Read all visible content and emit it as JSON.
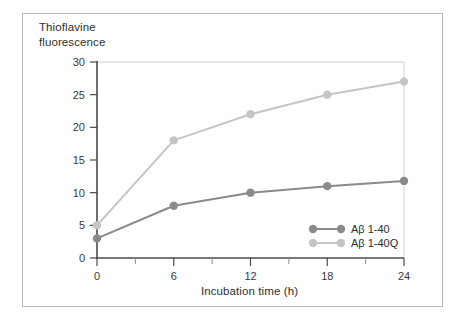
{
  "chart_data": {
    "type": "line",
    "title": "",
    "subtitle": "",
    "xlabel": "Incubation time (h)",
    "ylabel": "Thioflavine\nfluorescence",
    "x": [
      0,
      6,
      12,
      18,
      24
    ],
    "categories": [
      "0",
      "6",
      "12",
      "18",
      "24"
    ],
    "xlim": [
      0,
      24
    ],
    "ylim": [
      0,
      30
    ],
    "x_ticks": [
      0,
      6,
      12,
      18,
      24
    ],
    "x_tick_labels": [
      "0",
      "6",
      "12",
      "18",
      "24"
    ],
    "x_minor_ticks": [
      3,
      9,
      15,
      21
    ],
    "y_ticks": [
      0,
      5,
      10,
      15,
      20,
      25,
      30
    ],
    "y_tick_labels": [
      "0",
      "5",
      "10",
      "15",
      "20",
      "25",
      "30"
    ],
    "grid": false,
    "legend_position": "inside bottom-right",
    "series": [
      {
        "name": "Aβ 1-40",
        "color": "#8a8a8a",
        "marker": "circle",
        "values": [
          3,
          8,
          10,
          11,
          11.8
        ]
      },
      {
        "name": "Aβ 1-40Q",
        "color": "#c5c5c5",
        "marker": "circle",
        "values": [
          5,
          18,
          22,
          25,
          27
        ]
      }
    ]
  },
  "legend": {
    "entries": [
      {
        "label": "Aβ 1-40"
      },
      {
        "label": "Aβ 1-40Q"
      }
    ]
  },
  "axes": {
    "y_title": "Thioflavine\nfluorescence",
    "x_title": "Incubation time (h)"
  },
  "colors": {
    "series_dark": "#8a8a8a",
    "series_light": "#c5c5c5",
    "axis": "#4a4a4a",
    "frame": "#b9b9b9",
    "plot_frame": "#cfcfcf",
    "text": "#2e2e2e",
    "background": "#ffffff"
  }
}
